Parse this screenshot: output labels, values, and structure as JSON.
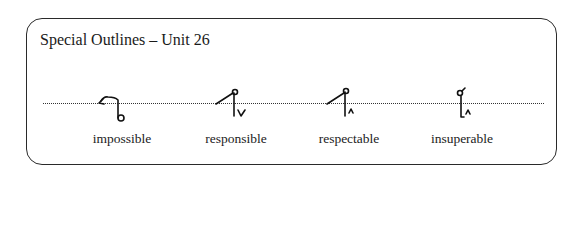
{
  "panel": {
    "title": "Special Outlines – Unit 26"
  },
  "outlines": [
    {
      "word": "impossible",
      "glyph": "impossible-outline"
    },
    {
      "word": "responsible",
      "glyph": "responsible-outline"
    },
    {
      "word": "respectable",
      "glyph": "respectable-outline"
    },
    {
      "word": "insuperable",
      "glyph": "insuperable-outline"
    }
  ]
}
